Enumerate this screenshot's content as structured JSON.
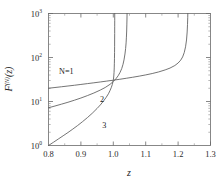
{
  "figure": {
    "background_color": "#ffffff",
    "frame_color": "#6a6a6a",
    "curve_color": "#5b5b5b"
  },
  "chart_data": {
    "type": "line",
    "title": "",
    "subtitle": "",
    "xlabel": "z",
    "ylabel": "F^(N)(z)",
    "ylabel_base": "F",
    "ylabel_superscript": "(N)",
    "ylabel_arg": "(z)",
    "xlim": [
      0.8,
      1.3
    ],
    "ylim": [
      1,
      1000
    ],
    "yscale": "log",
    "xscale": "linear",
    "grid": false,
    "legend_position": "inline-annotations",
    "xticks": [
      0.8,
      0.9,
      1.0,
      1.1,
      1.2,
      1.3
    ],
    "xtick_labels": [
      "0.8",
      "0.9",
      "1.0",
      "1.1",
      "1.2",
      "1.3"
    ],
    "yticks": [
      1,
      10,
      100,
      1000
    ],
    "ytick_labels": [
      "10",
      "10",
      "10",
      "10"
    ],
    "ytick_exponents": [
      "0",
      "1",
      "2",
      "3"
    ],
    "x_minor_tick_count": 1,
    "annotations": [
      {
        "text": "N=1",
        "x": 0.855,
        "y": 42.0
      },
      {
        "text": "2",
        "x": 0.965,
        "y": 9.6
      },
      {
        "text": "3",
        "x": 0.972,
        "y": 2.45
      }
    ],
    "series": [
      {
        "name": "N=1",
        "label": "N=1",
        "asymptote_z": 1.23,
        "start_value": 20.0,
        "points": [
          [
            0.8,
            20.0
          ],
          [
            0.82,
            20.8
          ],
          [
            0.84,
            21.6
          ],
          [
            0.86,
            22.5
          ],
          [
            0.88,
            23.4
          ],
          [
            0.9,
            24.4
          ],
          [
            0.92,
            25.5
          ],
          [
            0.94,
            26.6
          ],
          [
            0.96,
            27.8
          ],
          [
            0.98,
            29.1
          ],
          [
            1.0,
            30.5
          ],
          [
            1.02,
            32.0
          ],
          [
            1.04,
            33.7
          ],
          [
            1.06,
            35.6
          ],
          [
            1.08,
            37.7
          ],
          [
            1.1,
            40.2
          ],
          [
            1.12,
            43.2
          ],
          [
            1.14,
            47.0
          ],
          [
            1.16,
            52.2
          ],
          [
            1.175,
            57.5
          ],
          [
            1.19,
            65.8
          ],
          [
            1.2,
            75.0
          ],
          [
            1.208,
            87.0
          ],
          [
            1.214,
            103.0
          ],
          [
            1.219,
            130.0
          ],
          [
            1.223,
            175.0
          ],
          [
            1.226,
            250.0
          ],
          [
            1.228,
            380.0
          ],
          [
            1.229,
            560.0
          ],
          [
            1.2297,
            800.0
          ],
          [
            1.23,
            1000.0
          ]
        ]
      },
      {
        "name": "2",
        "label": "2",
        "asymptote_z": 1.042,
        "start_value": 7.2,
        "points": [
          [
            0.8,
            7.2
          ],
          [
            0.82,
            7.9
          ],
          [
            0.84,
            8.7
          ],
          [
            0.86,
            9.6
          ],
          [
            0.88,
            10.7
          ],
          [
            0.9,
            12.0
          ],
          [
            0.92,
            13.6
          ],
          [
            0.94,
            15.6
          ],
          [
            0.96,
            18.2
          ],
          [
            0.975,
            20.8
          ],
          [
            0.99,
            24.6
          ],
          [
            1.0,
            28.5
          ],
          [
            1.008,
            32.8
          ],
          [
            1.015,
            38.5
          ],
          [
            1.021,
            46.0
          ],
          [
            1.026,
            56.0
          ],
          [
            1.03,
            70.0
          ],
          [
            1.033,
            88.0
          ],
          [
            1.036,
            120.0
          ],
          [
            1.038,
            160.0
          ],
          [
            1.0395,
            215.0
          ],
          [
            1.0405,
            290.0
          ],
          [
            1.0413,
            400.0
          ],
          [
            1.0418,
            550.0
          ],
          [
            1.0422,
            750.0
          ],
          [
            1.0425,
            1000.0
          ]
        ]
      },
      {
        "name": "3",
        "label": "3",
        "asymptote_z": 1.004,
        "start_value": 1.0,
        "points": [
          [
            0.8,
            1.0
          ],
          [
            0.815,
            1.18
          ],
          [
            0.83,
            1.4
          ],
          [
            0.845,
            1.66
          ],
          [
            0.86,
            1.97
          ],
          [
            0.875,
            2.36
          ],
          [
            0.89,
            2.85
          ],
          [
            0.905,
            3.48
          ],
          [
            0.92,
            4.3
          ],
          [
            0.935,
            5.4
          ],
          [
            0.95,
            6.95
          ],
          [
            0.96,
            8.35
          ],
          [
            0.97,
            10.3
          ],
          [
            0.978,
            12.4
          ],
          [
            0.985,
            15.0
          ],
          [
            0.99,
            17.8
          ],
          [
            0.994,
            21.0
          ],
          [
            0.997,
            24.5
          ],
          [
            0.999,
            28.0
          ],
          [
            1.0005,
            32.0
          ],
          [
            1.0015,
            38.0
          ],
          [
            1.0023,
            46.0
          ],
          [
            1.0029,
            58.0
          ],
          [
            1.0033,
            74.0
          ],
          [
            1.0036,
            96.0
          ],
          [
            1.00385,
            130.0
          ],
          [
            1.00403,
            180.0
          ],
          [
            1.00415,
            250.0
          ],
          [
            1.00425,
            350.0
          ],
          [
            1.00432,
            500.0
          ],
          [
            1.00437,
            700.0
          ],
          [
            1.0044,
            1000.0
          ]
        ]
      }
    ]
  }
}
